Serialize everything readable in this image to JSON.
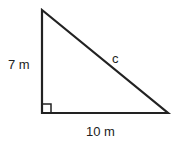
{
  "diagram": {
    "type": "right-triangle",
    "vertices": {
      "top": [
        42,
        10
      ],
      "bottom_left": [
        42,
        113
      ],
      "bottom_right": [
        168,
        113
      ]
    },
    "right_angle_at": "bottom_left",
    "labels": {
      "vertical_side": "7 m",
      "hypotenuse": "c",
      "horizontal_side": "10 m"
    },
    "stroke_color": "#222222"
  }
}
